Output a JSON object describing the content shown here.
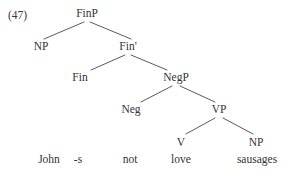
{
  "figure": {
    "example_number": "(47)",
    "caption": "",
    "background_color": "#ffffff",
    "line_color": "#5a5a5a",
    "text_color": "#333333"
  },
  "tree": {
    "nodes": [
      {
        "id": "finp",
        "label": "FinP",
        "x": 87,
        "y": 8,
        "level": 0
      },
      {
        "id": "np_subj",
        "label": "NP",
        "x": 41,
        "y": 41,
        "level": 1
      },
      {
        "id": "finbar",
        "label": "Fin'",
        "x": 128,
        "y": 41,
        "level": 1
      },
      {
        "id": "fin",
        "label": "Fin",
        "x": 80,
        "y": 72,
        "level": 2
      },
      {
        "id": "negp",
        "label": "NegP",
        "x": 176,
        "y": 72,
        "level": 2
      },
      {
        "id": "neg",
        "label": "Neg",
        "x": 131,
        "y": 104,
        "level": 3
      },
      {
        "id": "vp",
        "label": "VP",
        "x": 219,
        "y": 104,
        "level": 3
      },
      {
        "id": "v",
        "label": "V",
        "x": 181,
        "y": 137,
        "level": 4
      },
      {
        "id": "np_obj",
        "label": "NP",
        "x": 256,
        "y": 137,
        "level": 4
      }
    ],
    "terminals": [
      {
        "id": "t_john",
        "label": "John",
        "x": 49,
        "y": 154,
        "parent": "np_subj"
      },
      {
        "id": "t_s",
        "label": "-s",
        "x": 78,
        "y": 154,
        "parent": "fin"
      },
      {
        "id": "t_not",
        "label": "not",
        "x": 130,
        "y": 154,
        "parent": "neg"
      },
      {
        "id": "t_love",
        "label": "love",
        "x": 181,
        "y": 154,
        "parent": "v"
      },
      {
        "id": "t_sausages",
        "label": "sausages",
        "x": 257,
        "y": 154,
        "parent": "np_obj"
      }
    ],
    "branches": [
      {
        "id": "finp-np",
        "from": "finp",
        "to": "np_subj",
        "x1": 84,
        "y1": 22,
        "x2": 44,
        "y2": 39
      },
      {
        "id": "finp-finbar",
        "from": "finp",
        "to": "finbar",
        "x1": 90,
        "y1": 22,
        "x2": 131,
        "y2": 39
      },
      {
        "id": "finbar-fin",
        "from": "finbar",
        "to": "fin",
        "x1": 125,
        "y1": 55,
        "x2": 91,
        "y2": 70
      },
      {
        "id": "finbar-negp",
        "from": "finbar",
        "to": "negp",
        "x1": 131,
        "y1": 55,
        "x2": 167,
        "y2": 70
      },
      {
        "id": "negp-neg",
        "from": "negp",
        "to": "neg",
        "x1": 172,
        "y1": 86,
        "x2": 141,
        "y2": 102
      },
      {
        "id": "negp-vp",
        "from": "negp",
        "to": "vp",
        "x1": 180,
        "y1": 86,
        "x2": 215,
        "y2": 102
      },
      {
        "id": "vp-v",
        "from": "vp",
        "to": "v",
        "x1": 215,
        "y1": 118,
        "x2": 186,
        "y2": 134
      },
      {
        "id": "vp-np",
        "from": "vp",
        "to": "np_obj",
        "x1": 223,
        "y1": 118,
        "x2": 253,
        "y2": 134
      }
    ]
  }
}
